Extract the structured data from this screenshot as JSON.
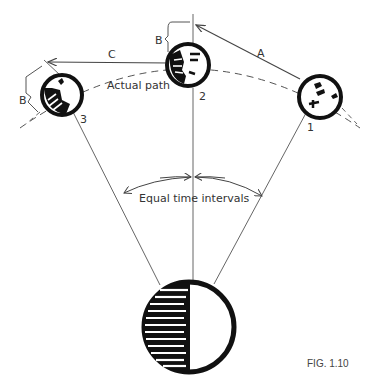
{
  "diagram": {
    "labels": {
      "arrow_a": "A",
      "arrow_c": "C",
      "bracket_b_left": "B",
      "bracket_b_top": "B",
      "actual_path": "Actual path",
      "moon_1": "1",
      "moon_2": "2",
      "moon_3": "3",
      "equal_time": "Equal time intervals"
    },
    "caption": "FIG. 1.10",
    "colors": {
      "ink": "#111111",
      "line": "#555555",
      "background": "#ffffff"
    }
  }
}
